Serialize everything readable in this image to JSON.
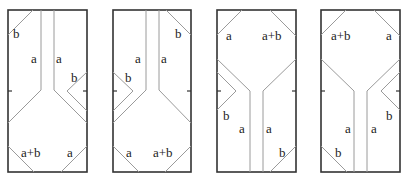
{
  "figure": {
    "panels": [
      {
        "id": "panel-1",
        "labels": [
          {
            "text": "b",
            "x": 16,
            "y": 40
          },
          {
            "text": "a",
            "x": 31,
            "y": 64
          },
          {
            "text": "a",
            "x": 57,
            "y": 64
          },
          {
            "text": "b",
            "x": 71,
            "y": 81
          },
          {
            "text": "a+b",
            "x": 21,
            "y": 156
          },
          {
            "text": "a",
            "x": 67,
            "y": 156
          }
        ]
      },
      {
        "id": "panel-2",
        "labels": [
          {
            "text": "b",
            "x": 176,
            "y": 40
          },
          {
            "text": "a",
            "x": 135,
            "y": 64
          },
          {
            "text": "a",
            "x": 161,
            "y": 64
          },
          {
            "text": "b",
            "x": 125,
            "y": 81
          },
          {
            "text": "a",
            "x": 126,
            "y": 156
          },
          {
            "text": "a+b",
            "x": 153,
            "y": 156
          }
        ]
      },
      {
        "id": "panel-3",
        "labels": [
          {
            "text": "a",
            "x": 225,
            "y": 42
          },
          {
            "text": "a+b",
            "x": 262,
            "y": 42
          },
          {
            "text": "b",
            "x": 224,
            "y": 120
          },
          {
            "text": "a",
            "x": 239,
            "y": 133
          },
          {
            "text": "a",
            "x": 265,
            "y": 133
          },
          {
            "text": "b",
            "x": 279,
            "y": 157
          }
        ]
      },
      {
        "id": "panel-4",
        "labels": [
          {
            "text": "a+b",
            "x": 331,
            "y": 42
          },
          {
            "text": "a",
            "x": 386,
            "y": 42
          },
          {
            "text": "b",
            "x": 386,
            "y": 120
          },
          {
            "text": "a",
            "x": 345,
            "y": 133
          },
          {
            "text": "a",
            "x": 371,
            "y": 133
          },
          {
            "text": "b",
            "x": 335,
            "y": 157
          }
        ]
      }
    ]
  }
}
